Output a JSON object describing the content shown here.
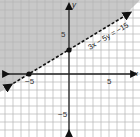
{
  "chart_data": {
    "type": "line",
    "title": "",
    "xlabel": "x",
    "ylabel": "y",
    "xlim": [
      -8.6,
      8.9
    ],
    "ylim": [
      -7.9,
      9.2
    ],
    "grid": true,
    "x_tick_labels": [
      {
        "value": -5,
        "label": "−5"
      },
      {
        "value": 5,
        "label": "5"
      }
    ],
    "y_tick_labels": [
      {
        "value": 5,
        "label": "5"
      },
      {
        "value": -5,
        "label": "−5"
      }
    ],
    "series": [
      {
        "name": "3x − 5y = −15",
        "equation": "3x − 5y = −15",
        "style": "dashed",
        "slope": 0.6,
        "intercept": 3,
        "points": [
          {
            "x": -5,
            "y": 0
          },
          {
            "x": 0,
            "y": 3
          }
        ]
      }
    ],
    "shaded_region": "above line (3x − 5y < −15)",
    "annotations": [
      {
        "text": "3x − 5y = −15",
        "x": 3.5,
        "y": 4.6
      }
    ]
  },
  "labels": {
    "equation": "3x − 5y = −15",
    "x_axis": "x",
    "y_axis": "y",
    "tick_pos": "5",
    "tick_neg_x": "−5",
    "tick_neg_y": "−5",
    "tick_y_pos": "5"
  },
  "colors": {
    "shade": "#c8c8c8",
    "grid": "#b4b4b4",
    "axis": "#222222",
    "line": "#111111"
  }
}
